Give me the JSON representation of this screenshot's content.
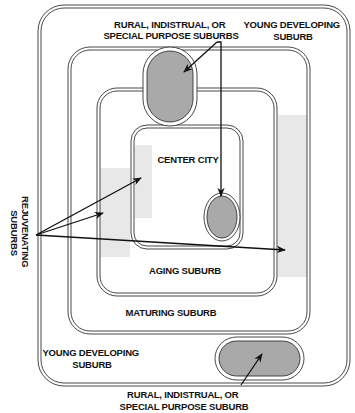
{
  "diagram": {
    "type": "nested-zones",
    "colors": {
      "line": "#333333",
      "special_fill": "#a9a9a9",
      "rejuvenating_fill": "#e8e8e8",
      "background": "#ffffff"
    },
    "zones": [
      {
        "id": "young-developing",
        "label_top": [
          "YOUNG DEVELOPING",
          "SUBURB"
        ],
        "label_bottom": [
          "YOUNG DEVELOPING",
          "SUBURB"
        ]
      },
      {
        "id": "maturing",
        "label": "MATURING SUBURB"
      },
      {
        "id": "aging",
        "label": "AGING SUBURB"
      },
      {
        "id": "center-city",
        "label": "CENTER CITY"
      }
    ],
    "callouts": {
      "special_top": [
        "RURAL, INDISTRUAL, OR",
        "SPECIAL PURPOSE SUBURBS"
      ],
      "special_bottom": [
        "RURAL, INDISTRUAL, OR",
        "SPECIAL PURPOSE SUBURB"
      ],
      "rejuvenating": [
        "REJUVENATING",
        "SUBURBS"
      ]
    }
  }
}
